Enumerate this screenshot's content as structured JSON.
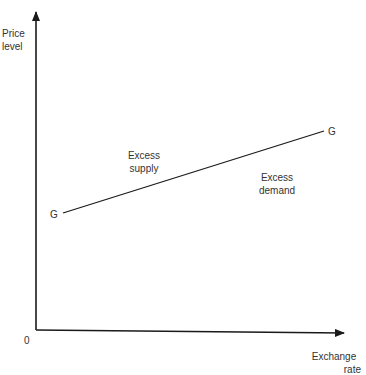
{
  "diagram": {
    "title": "",
    "y_axis_label": [
      "Price",
      "level"
    ],
    "x_axis_label": [
      "Exchange",
      "rate"
    ],
    "origin_label": "0",
    "curve": {
      "name": "G",
      "start_label": "G",
      "end_label": "G",
      "slope": "upward"
    },
    "regions": {
      "above": [
        "Excess",
        "supply"
      ],
      "below": [
        "Excess",
        "demand"
      ]
    },
    "colors": {
      "line": "#2a2a2a",
      "text": "#333333",
      "background": "#ffffff"
    }
  }
}
